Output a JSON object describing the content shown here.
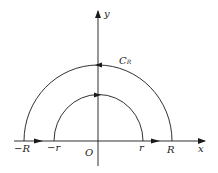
{
  "diagram": {
    "type": "contour-integration-path",
    "labels": {
      "y_axis": "y",
      "x_axis": "x",
      "origin": "O",
      "neg_R": "−R",
      "neg_r": "−r",
      "pos_r": "r",
      "pos_R": "R",
      "curve_C": "C",
      "curve_C_sub": "R"
    },
    "colors": {
      "stroke": "#1a1a1a",
      "background": "#ffffff"
    },
    "elements": [
      {
        "name": "outer-semicircle",
        "radius": "R",
        "direction": "counterclockwise"
      },
      {
        "name": "inner-semicircle",
        "radius": "r",
        "direction": "clockwise"
      },
      {
        "name": "segment-neg-R-to-neg-r",
        "direction": "right"
      },
      {
        "name": "segment-r-to-R",
        "direction": "right"
      }
    ]
  }
}
